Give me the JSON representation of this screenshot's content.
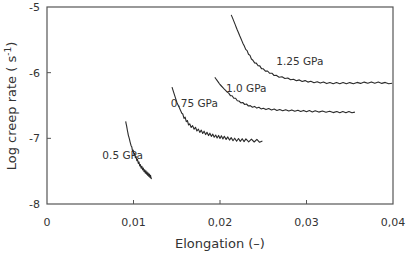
{
  "chart_data": {
    "type": "line",
    "title": "",
    "xlabel": "Elongation (–)",
    "ylabel": "Log creep rate ( s⁻¹)",
    "xlim": [
      0,
      0.04
    ],
    "ylim": [
      -8,
      -5
    ],
    "x_ticks": [
      "0",
      "0,01",
      "0,02",
      "0,03",
      "0,04"
    ],
    "y_ticks": [
      "-5",
      "-6",
      "-7",
      "-8"
    ],
    "grid": false,
    "legend": "inline labels",
    "series": [
      {
        "name": "0.5 GPa",
        "label_pos": [
          0.0064,
          -7.32
        ],
        "points": [
          [
            0.0091,
            -6.74
          ],
          [
            0.0094,
            -6.95
          ],
          [
            0.0098,
            -7.15
          ],
          [
            0.0103,
            -7.3
          ],
          [
            0.0108,
            -7.42
          ],
          [
            0.0113,
            -7.5
          ],
          [
            0.0117,
            -7.55
          ],
          [
            0.0121,
            -7.6
          ]
        ]
      },
      {
        "name": "0.75 GPa",
        "label_pos": [
          0.0143,
          -6.52
        ],
        "points": [
          [
            0.01445,
            -6.22
          ],
          [
            0.015,
            -6.45
          ],
          [
            0.0157,
            -6.65
          ],
          [
            0.0165,
            -6.8
          ],
          [
            0.0175,
            -6.88
          ],
          [
            0.0185,
            -6.93
          ],
          [
            0.0195,
            -6.97
          ],
          [
            0.0205,
            -6.99
          ],
          [
            0.0217,
            -7.02
          ],
          [
            0.023,
            -7.03
          ],
          [
            0.0249,
            -7.04
          ]
        ]
      },
      {
        "name": "1.0 GPa",
        "label_pos": [
          0.0207,
          -6.29
        ],
        "points": [
          [
            0.0194,
            -6.07
          ],
          [
            0.02,
            -6.18
          ],
          [
            0.021,
            -6.32
          ],
          [
            0.0222,
            -6.44
          ],
          [
            0.0235,
            -6.51
          ],
          [
            0.025,
            -6.55
          ],
          [
            0.0269,
            -6.57
          ],
          [
            0.029,
            -6.58
          ],
          [
            0.031,
            -6.59
          ],
          [
            0.0335,
            -6.6
          ],
          [
            0.0356,
            -6.6
          ]
        ]
      },
      {
        "name": "1.25 GPa",
        "label_pos": [
          0.0265,
          -5.88
        ],
        "points": [
          [
            0.0213,
            -5.12
          ],
          [
            0.022,
            -5.35
          ],
          [
            0.0228,
            -5.6
          ],
          [
            0.0238,
            -5.82
          ],
          [
            0.025,
            -5.95
          ],
          [
            0.0265,
            -6.05
          ],
          [
            0.0285,
            -6.11
          ],
          [
            0.0305,
            -6.14
          ],
          [
            0.0327,
            -6.16
          ],
          [
            0.035,
            -6.16
          ],
          [
            0.0375,
            -6.15
          ],
          [
            0.0399,
            -6.16
          ]
        ]
      }
    ]
  },
  "axes": {
    "x_title": "Elongation (–)",
    "y_title": "Log creep rate ( s",
    "y_title_sup": "-1",
    "y_title_end": ")"
  },
  "colors": {
    "line": "#2a2a2a",
    "frame": "#555555",
    "text": "#333333",
    "background": "#ffffff"
  }
}
